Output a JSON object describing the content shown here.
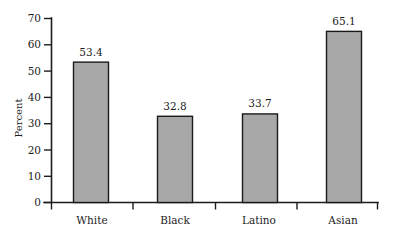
{
  "chart_data": {
    "type": "bar",
    "title": "",
    "subtitle": "",
    "xlabel": "",
    "ylabel": "Percent",
    "categories": [
      "White",
      "Black",
      "Latino",
      "Asian"
    ],
    "values": [
      53.4,
      32.8,
      33.7,
      65.1
    ],
    "value_labels": [
      "53.4",
      "32.8",
      "33.7",
      "65.1"
    ],
    "ylim": [
      0,
      70
    ],
    "ytick_labels": [
      "0",
      "10",
      "20",
      "30",
      "40",
      "50",
      "60",
      "70"
    ],
    "ytick_values": [
      0,
      10,
      20,
      30,
      40,
      50,
      60,
      70
    ],
    "grid": false,
    "legend": false,
    "legend_position": "none",
    "bar_fill_color": "#a8a8a8",
    "bar_edge_color": "#1a1a1a",
    "axis_color": "#1c1c1c",
    "background_color": "#ffffff"
  },
  "axes": {
    "y_title": "Percent"
  }
}
